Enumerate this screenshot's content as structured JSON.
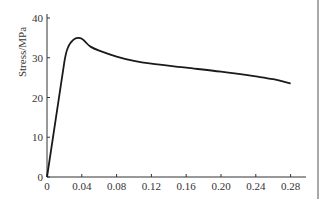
{
  "chart_data": {
    "type": "line",
    "title": "",
    "xlabel": "",
    "ylabel": "Stress/MPa",
    "xlim": [
      0,
      0.3
    ],
    "ylim": [
      0,
      40
    ],
    "xticks": [
      "0",
      "0.04",
      "0.08",
      "0.12",
      "0.16",
      "0.20",
      "0.24",
      "0.28"
    ],
    "yticks": [
      "0",
      "10",
      "20",
      "30",
      "40"
    ],
    "grid": false,
    "legend": null,
    "series": [
      {
        "name": "stress-strain",
        "x": [
          0,
          0.01,
          0.02,
          0.024,
          0.028,
          0.032,
          0.036,
          0.04,
          0.044,
          0.05,
          0.06,
          0.08,
          0.1,
          0.12,
          0.16,
          0.2,
          0.24,
          0.26,
          0.28
        ],
        "y": [
          0,
          14.5,
          29.0,
          32.5,
          34.0,
          34.8,
          35.0,
          34.8,
          34.0,
          32.8,
          31.8,
          30.3,
          29.2,
          28.5,
          27.5,
          26.5,
          25.3,
          24.6,
          23.5
        ]
      }
    ]
  }
}
